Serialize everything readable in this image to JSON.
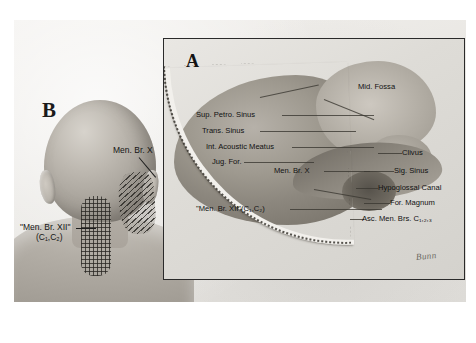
{
  "figure": {
    "panels": [
      {
        "letter": "B",
        "name": "posterior-head-neck-view",
        "labels": [
          {
            "id": "men-br-x",
            "text": "Men. Br. X"
          },
          {
            "id": "men-br-xii",
            "text": "\"Men. Br. XII\"",
            "subtext": "(C₁,C₂)"
          }
        ],
        "regions": [
          {
            "id": "grid-patch",
            "name": "cross-hatched-occipital-patch"
          },
          {
            "id": "diagonal-patch",
            "name": "diagonal-hatched-mastoid-patch"
          }
        ]
      },
      {
        "letter": "A",
        "name": "skull-base-inset",
        "labels": [
          {
            "id": "mid-fossa",
            "text": "Mid. Fossa"
          },
          {
            "id": "sup-petro-sinus",
            "text": "Sup. Petro. Sinus"
          },
          {
            "id": "trans-sinus",
            "text": "Trans. Sinus"
          },
          {
            "id": "int-acoustic-meatus",
            "text": "Int. Acoustic Meatus"
          },
          {
            "id": "jug-for",
            "text": "Jug. For."
          },
          {
            "id": "men-br-x",
            "text": "Men. Br. X"
          },
          {
            "id": "men-br-xii",
            "text": "\"Men. Br. XII\"(C₁,C₂)"
          },
          {
            "id": "clivus",
            "text": "Clivus"
          },
          {
            "id": "sig-sinus",
            "text": "Sig. Sinus"
          },
          {
            "id": "hypoglossal-canal",
            "text": "Hypoglossal Canal"
          },
          {
            "id": "for-magnum",
            "text": "For. Magnum"
          },
          {
            "id": "asc-men-brs",
            "text": "Asc. Men. Brs. C₁,₂,₃"
          }
        ],
        "signature": "Bunn"
      }
    ],
    "colors": {
      "page_background": "#ffffff",
      "plate_background": "#eceae6",
      "inset_border": "#2a2a2a",
      "ink": "#141414",
      "tissue_mid": "#aaa49c",
      "tissue_dark": "#7e7970"
    }
  }
}
